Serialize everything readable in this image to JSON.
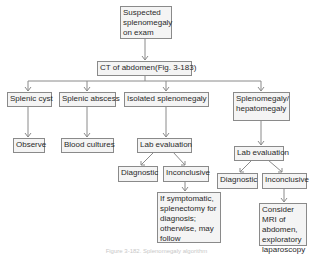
{
  "diagram": {
    "type": "flowchart",
    "nodes": {
      "start": "Suspected splenomegaly on exam",
      "ct": "CT of abdomen(Fig. 3-183)",
      "cyst": "Splenic cyst",
      "abscess": "Splenic abscess",
      "isolated": "Isolated splenomegaly",
      "hepato": "Splenomegaly/ hepatomegaly",
      "observe": "Observe",
      "blood": "Blood cultures",
      "lab1": "Lab evaluation",
      "diag1": "Diagnostic",
      "incon1": "Inconclusive",
      "symptomatic": "If symptomatic, splenectomy for diagnosis; otherwise, may follow",
      "lab2": "Lab evaluation",
      "diag2": "Diagnostic",
      "incon2": "Inconclusive",
      "mri": "Consider MRI of abdomen, exploratory laparoscopy"
    },
    "edges": [
      [
        "start",
        "ct"
      ],
      [
        "ct",
        "cyst"
      ],
      [
        "ct",
        "abscess"
      ],
      [
        "ct",
        "isolated"
      ],
      [
        "ct",
        "hepato"
      ],
      [
        "cyst",
        "observe"
      ],
      [
        "abscess",
        "blood"
      ],
      [
        "isolated",
        "lab1"
      ],
      [
        "lab1",
        "diag1"
      ],
      [
        "lab1",
        "incon1"
      ],
      [
        "incon1",
        "symptomatic"
      ],
      [
        "hepato",
        "lab2"
      ],
      [
        "lab2",
        "diag2"
      ],
      [
        "lab2",
        "incon2"
      ],
      [
        "incon2",
        "mri"
      ]
    ],
    "caption": "Figure 3-182. Splenomegaly algorithm",
    "colors": {
      "box_border": "#8a8a8a",
      "box_fill": "#f4f4f4",
      "line": "#8a8a8a",
      "text": "#2a2a2a"
    }
  }
}
